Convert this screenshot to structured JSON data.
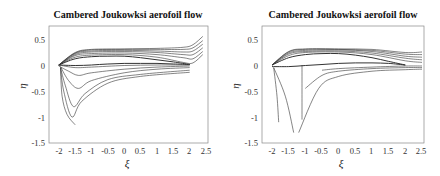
{
  "chart_data": [
    {
      "type": "line",
      "title": "Cambered Joukowksi aerofoil flow",
      "xlabel": "ξ",
      "ylabel": "η",
      "xlim": [
        -2.3,
        2.56
      ],
      "ylim": [
        -1.5,
        0.75
      ],
      "xticks": [
        "-2",
        "-1.5",
        "-1",
        "-0.5",
        "0",
        "0.5",
        "1",
        "1.5",
        "2",
        "2.5"
      ],
      "yticks": [
        "0.5",
        "0",
        "-0.5",
        "-1",
        "-1.5"
      ],
      "grid": false,
      "description": "Streamlines around a cambered Joukowski aerofoil (leading edge ~(-2,0), trailing edge ~(2,0)); upper streamlines curl upward past trailing edge to ~0.2–0.55 at ξ≈2.4; lower streamlines drop from leading edge to η≈-0.85 to -1.15 near ξ≈-1.9 to -1.5",
      "series": [
        {
          "name": "aerofoil-upper",
          "x": [
            -2,
            -1.5,
            -1,
            -0.5,
            0,
            0.5,
            1,
            1.5,
            2
          ],
          "y": [
            0,
            0.12,
            0.16,
            0.17,
            0.17,
            0.14,
            0.1,
            0.06,
            0.01
          ]
        },
        {
          "name": "aerofoil-lower",
          "x": [
            -2,
            -1.5,
            -1,
            -0.5,
            0,
            0.5,
            1,
            1.5,
            2
          ],
          "y": [
            0,
            -0.01,
            0.0,
            0.02,
            0.03,
            0.03,
            0.03,
            0.02,
            0.01
          ]
        },
        {
          "name": "upper-1",
          "x": [
            -2,
            -1.5,
            -1,
            0,
            1,
            1.8,
            2.1,
            2.4
          ],
          "y": [
            0,
            0.15,
            0.19,
            0.2,
            0.15,
            0.05,
            0.04,
            0.2
          ]
        },
        {
          "name": "upper-2",
          "x": [
            -2,
            -1.5,
            -1,
            0,
            1,
            1.8,
            2.1,
            2.4
          ],
          "y": [
            0,
            0.18,
            0.22,
            0.23,
            0.2,
            0.14,
            0.12,
            0.26
          ]
        },
        {
          "name": "upper-3",
          "x": [
            -2,
            -1.5,
            -1,
            0,
            1,
            1.8,
            2.1,
            2.4
          ],
          "y": [
            0,
            0.2,
            0.25,
            0.26,
            0.24,
            0.2,
            0.2,
            0.33
          ]
        },
        {
          "name": "upper-4",
          "x": [
            -2,
            -1.5,
            -1,
            0,
            1,
            1.8,
            2.1,
            2.4
          ],
          "y": [
            0,
            0.22,
            0.27,
            0.28,
            0.27,
            0.25,
            0.27,
            0.4
          ]
        },
        {
          "name": "upper-5",
          "x": [
            -2,
            -1.5,
            -1,
            0,
            1,
            1.8,
            2.1,
            2.4
          ],
          "y": [
            0,
            0.23,
            0.29,
            0.3,
            0.3,
            0.3,
            0.33,
            0.47
          ]
        },
        {
          "name": "upper-6",
          "x": [
            -2,
            -1.5,
            -1,
            0,
            1,
            1.8,
            2.1,
            2.4
          ],
          "y": [
            0,
            0.24,
            0.3,
            0.31,
            0.32,
            0.34,
            0.39,
            0.55
          ]
        },
        {
          "name": "lower-1",
          "x": [
            -2,
            -1.5,
            -1,
            0,
            1,
            2
          ],
          "y": [
            0,
            -0.05,
            -0.04,
            -0.01,
            0.0,
            0.0
          ]
        },
        {
          "name": "lower-2",
          "x": [
            -2,
            -1.7,
            -1.4,
            -1,
            0,
            1,
            2
          ],
          "y": [
            -0.02,
            -0.12,
            -0.2,
            -0.15,
            -0.08,
            -0.04,
            -0.02
          ]
        },
        {
          "name": "lower-3",
          "x": [
            -1.95,
            -1.7,
            -1.4,
            -1,
            0,
            1,
            2
          ],
          "y": [
            -0.03,
            -0.3,
            -0.45,
            -0.3,
            -0.15,
            -0.08,
            -0.05
          ]
        },
        {
          "name": "lower-4",
          "x": [
            -1.95,
            -1.8,
            -1.55,
            -1.2,
            -0.5,
            0.5,
            2
          ],
          "y": [
            -0.05,
            -0.4,
            -0.8,
            -0.55,
            -0.28,
            -0.18,
            -0.1
          ]
        },
        {
          "name": "lower-5",
          "x": [
            -1.95,
            -1.85,
            -1.6,
            -1.3,
            -0.5,
            0.5,
            2
          ],
          "y": [
            -0.05,
            -0.5,
            -1.0,
            -0.7,
            -0.35,
            -0.22,
            -0.14
          ]
        },
        {
          "name": "lower-6",
          "x": [
            -1.95,
            -1.9,
            -1.75,
            -1.5
          ],
          "y": [
            -0.05,
            -0.6,
            -0.95,
            -1.15
          ]
        }
      ]
    },
    {
      "type": "line",
      "title": "Cambered Joukowksi aerofoil flow",
      "xlabel": "ξ",
      "ylabel": "η",
      "xlim": [
        -2.3,
        2.56
      ],
      "ylim": [
        -1.5,
        0.75
      ],
      "xticks": [
        "-2",
        "-1.5",
        "-1",
        "-0.5",
        "0",
        "0.5",
        "1",
        "1.5",
        "2",
        "2.5"
      ],
      "yticks": [
        "0.5",
        "0",
        "-0.5",
        "-1",
        "-1.5"
      ],
      "grid": false,
      "description": "Streamlines around the same cambered Joukowski aerofoil with a different circulation; upper streamlines leave smoothly toward ξ≈2.5 at η≈0–0.25; lower streamlines drop from leading edge to η≈-1.1 to -1.35 near ξ≈-1.8 to -1.2; one vertical streamline near ξ≈-1.1",
      "series": [
        {
          "name": "aerofoil-upper",
          "x": [
            -2,
            -1.5,
            -1,
            -0.5,
            0,
            0.5,
            1,
            1.5,
            2
          ],
          "y": [
            0,
            0.14,
            0.2,
            0.22,
            0.22,
            0.19,
            0.14,
            0.07,
            0.0
          ]
        },
        {
          "name": "aerofoil-lower",
          "x": [
            -2,
            -1.5,
            -1,
            -0.5,
            0,
            0.5,
            1,
            1.5,
            2
          ],
          "y": [
            -0.03,
            -0.03,
            -0.01,
            0.01,
            0.03,
            0.04,
            0.04,
            0.03,
            0.0
          ]
        },
        {
          "name": "upper-1",
          "x": [
            -2,
            -1.5,
            -1,
            0,
            1,
            2,
            2.5
          ],
          "y": [
            0,
            0.18,
            0.24,
            0.25,
            0.2,
            0.08,
            0.05
          ]
        },
        {
          "name": "upper-2",
          "x": [
            -2,
            -1.5,
            -1,
            0,
            1,
            2,
            2.5
          ],
          "y": [
            0,
            0.21,
            0.26,
            0.27,
            0.23,
            0.13,
            0.1
          ]
        },
        {
          "name": "upper-3",
          "x": [
            -2,
            -1.5,
            -1,
            0,
            1,
            2,
            2.5
          ],
          "y": [
            0,
            0.23,
            0.28,
            0.29,
            0.26,
            0.17,
            0.15
          ]
        },
        {
          "name": "upper-4",
          "x": [
            -2,
            -1.5,
            -1,
            0,
            1,
            2,
            2.5
          ],
          "y": [
            0,
            0.25,
            0.3,
            0.3,
            0.28,
            0.21,
            0.2
          ]
        },
        {
          "name": "upper-5",
          "x": [
            -2,
            -1.5,
            -1,
            0,
            1,
            2,
            2.5
          ],
          "y": [
            0,
            0.26,
            0.31,
            0.31,
            0.3,
            0.24,
            0.25
          ]
        },
        {
          "name": "lower-1",
          "x": [
            -1.1,
            -1.1,
            -1.1
          ],
          "y": [
            0.0,
            -0.5,
            -1.05
          ]
        },
        {
          "name": "lower-2",
          "x": [
            -0.5,
            0,
            1,
            2,
            2.5
          ],
          "y": [
            -0.1,
            -0.07,
            -0.04,
            -0.02,
            -0.02
          ]
        },
        {
          "name": "lower-3",
          "x": [
            -1.0,
            -0.5,
            0,
            1,
            2,
            2.5
          ],
          "y": [
            -0.45,
            -0.2,
            -0.12,
            -0.07,
            -0.05,
            -0.05
          ]
        },
        {
          "name": "lower-4",
          "x": [
            -1.2,
            -0.6,
            0,
            1,
            2,
            2.5
          ],
          "y": [
            -1.3,
            -0.45,
            -0.22,
            -0.12,
            -0.09,
            -0.08
          ]
        },
        {
          "name": "lower-5",
          "x": [
            -1.95,
            -1.85,
            -1.8
          ],
          "y": [
            -0.05,
            -0.6,
            -1.1
          ]
        },
        {
          "name": "lower-6",
          "x": [
            -1.95,
            -1.6,
            -1.35
          ],
          "y": [
            -0.05,
            -0.6,
            -1.3
          ]
        }
      ]
    }
  ],
  "panels": [
    {
      "title": "Cambered Joukowksi aerofoil flow",
      "xlabel": "ξ",
      "ylabel": "η"
    },
    {
      "title": "Cambered Joukowksi aerofoil flow",
      "xlabel": "ξ",
      "ylabel": "η"
    }
  ]
}
